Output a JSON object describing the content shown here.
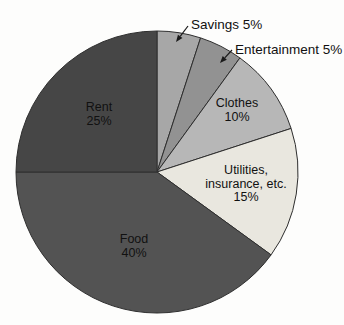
{
  "chart_data": {
    "type": "pie",
    "title": "",
    "categories": [
      "Savings",
      "Entertainment",
      "Clothes",
      "Utilities, insurance, etc.",
      "Food",
      "Rent"
    ],
    "values": [
      5,
      5,
      10,
      15,
      40,
      25
    ],
    "unit": "%",
    "direction": "clockwise",
    "start_angle_deg": 0,
    "geometry": {
      "cx": 157,
      "cy": 172,
      "r": 141
    },
    "style": {
      "slice_stroke": "#2e2e2e",
      "slice_stroke_width": 1,
      "label_color": "#111111",
      "leader_color": "#1a1a1a",
      "background": "#fdfdfc",
      "inside_line_height": 13.5
    },
    "slices": [
      {
        "id": "savings",
        "label": "Savings",
        "value": 5,
        "color": "#a7a7a7",
        "label_placement": "outside"
      },
      {
        "id": "entertainment",
        "label": "Entertainment",
        "value": 5,
        "color": "#929292",
        "label_placement": "outside"
      },
      {
        "id": "clothes",
        "label": "Clothes",
        "value": 10,
        "color": "#b7b7b7",
        "label_placement": "inside",
        "label_lines": [
          "Clothes",
          "10%"
        ],
        "label_pos": {
          "x": 237,
          "y": 107
        }
      },
      {
        "id": "utilities",
        "label": "Utilities, insurance, etc.",
        "value": 15,
        "color": "#e9e7df",
        "label_placement": "inside",
        "label_lines": [
          "Utilities,",
          "insurance, etc.",
          "15%"
        ],
        "label_pos": {
          "x": 246,
          "y": 174
        }
      },
      {
        "id": "food",
        "label": "Food",
        "value": 40,
        "color": "#535353",
        "label_placement": "inside",
        "label_lines": [
          "Food",
          "40%"
        ],
        "label_pos": {
          "x": 134,
          "y": 243
        }
      },
      {
        "id": "rent",
        "label": "Rent",
        "value": 25,
        "color": "#464646",
        "label_placement": "inside",
        "label_lines": [
          "Rent",
          "25%"
        ],
        "label_pos": {
          "x": 99,
          "y": 111
        }
      }
    ],
    "external_labels": [
      {
        "for": "savings",
        "text": "Savings 5%",
        "x": 191,
        "y": 29,
        "leader": {
          "x1": 188,
          "y1": 26,
          "x2": 176,
          "y2": 42
        }
      },
      {
        "for": "entertainment",
        "text": "Entertainment 5%",
        "x": 235,
        "y": 54,
        "leader": {
          "x1": 232,
          "y1": 50,
          "x2": 220,
          "y2": 63
        }
      }
    ]
  }
}
